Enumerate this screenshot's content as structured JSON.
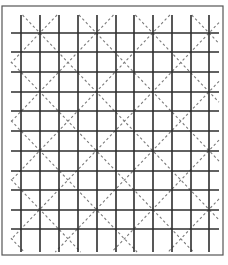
{
  "diagram": {
    "type": "square-grid-with-diagonal-lattice",
    "colors": {
      "background": "#ffffff",
      "border": "#555555",
      "grid_line": "#2e2e2e",
      "diagonal_dash": "#7a7a7a"
    },
    "border": {
      "x": 2,
      "y": 6,
      "width": 221,
      "height": 249
    },
    "grid": {
      "vertical_lines_x": [
        21,
        40,
        59,
        78,
        97,
        116,
        134,
        153,
        172,
        191,
        209
      ],
      "vertical_span_y": [
        15,
        252
      ],
      "horizontal_lines_y": [
        33,
        52,
        72,
        92,
        111,
        131,
        151,
        171,
        190,
        210,
        229
      ],
      "horizontal_span_x": [
        11,
        219
      ]
    },
    "diagonals": {
      "period_cells": 3,
      "descending_offset": 1,
      "ascending_offset": 1,
      "dash_pattern": "2.5,2.5"
    }
  }
}
